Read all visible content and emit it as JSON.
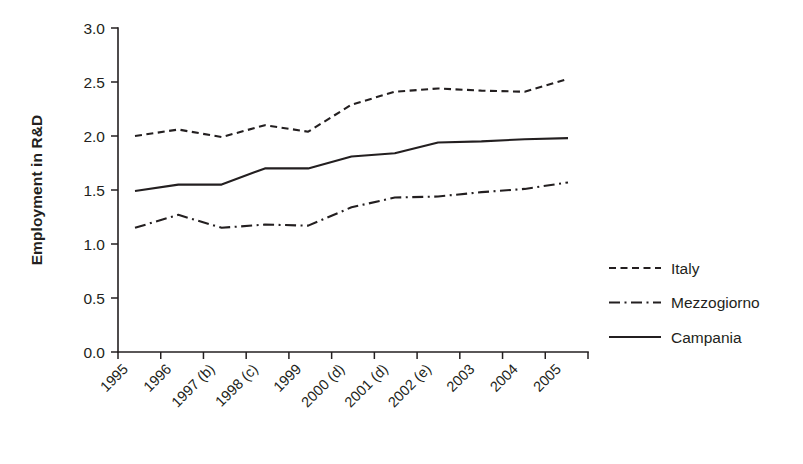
{
  "chart_data": {
    "type": "line",
    "title": "",
    "subtitle": "",
    "xlabel": "",
    "ylabel": "Employment in R&D",
    "categories": [
      "1995",
      "1996",
      "1997 (b)",
      "1998 (c)",
      "1999",
      "2000 (d)",
      "2001 (d)",
      "2002 (e)",
      "2003",
      "2004",
      "2005"
    ],
    "x": [
      "1995",
      "1996",
      "1997 (b)",
      "1998 (c)",
      "1999",
      "2000 (d)",
      "2001 (d)",
      "2002 (e)",
      "2003",
      "2004",
      "2005"
    ],
    "ylim": [
      0.0,
      3.0
    ],
    "yticks": [
      "0.0",
      "0.5",
      "1.0",
      "1.5",
      "2.0",
      "2.5",
      "3.0"
    ],
    "ytick_values": [
      0.0,
      0.5,
      1.0,
      1.5,
      2.0,
      2.5,
      3.0
    ],
    "grid": false,
    "legend_position": "right",
    "series": [
      {
        "name": "Italy",
        "style": "dashed",
        "color": "#231f20",
        "values": [
          2.0,
          2.06,
          1.99,
          2.1,
          2.04,
          2.29,
          2.41,
          2.44,
          2.42,
          2.41,
          2.53
        ]
      },
      {
        "name": "Mezzogiorno",
        "style": "dash-dot",
        "color": "#231f20",
        "values": [
          1.15,
          1.27,
          1.15,
          1.18,
          1.17,
          1.34,
          1.43,
          1.44,
          1.48,
          1.51,
          1.57
        ]
      },
      {
        "name": "Campania",
        "style": "solid",
        "color": "#231f20",
        "values": [
          1.49,
          1.55,
          1.55,
          1.7,
          1.7,
          1.81,
          1.84,
          1.94,
          1.95,
          1.97,
          1.98
        ]
      }
    ],
    "annotations": []
  },
  "legend": {
    "entries": [
      {
        "label": "Italy",
        "style": "dashed"
      },
      {
        "label": "Mezzogiorno",
        "style": "dash-dot"
      },
      {
        "label": "Campania",
        "style": "solid"
      }
    ]
  },
  "colors": {
    "ink": "#231f20",
    "background": "#ffffff"
  }
}
